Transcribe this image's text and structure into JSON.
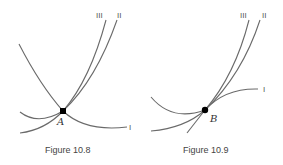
{
  "figures": [
    {
      "caption": "Figure 10.8",
      "point": {
        "label": "A",
        "x": 63,
        "y": 111
      },
      "curve_labels": {
        "I": "I",
        "II": "II",
        "III": "III"
      }
    },
    {
      "caption": "Figure 10.9",
      "point": {
        "label": "B",
        "x": 205,
        "y": 110
      },
      "curve_labels": {
        "I": "I",
        "II": "II",
        "III": "III"
      }
    }
  ],
  "colors": {
    "curve": "#6a6a6a",
    "point": "#000000",
    "text": "#444444"
  }
}
